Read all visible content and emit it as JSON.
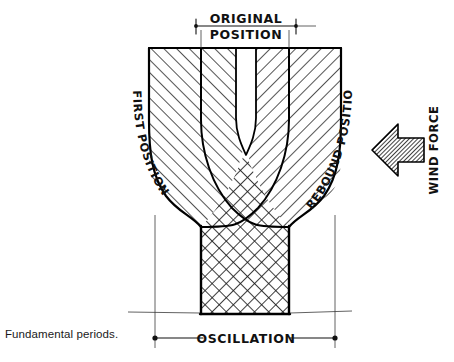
{
  "figure": {
    "caption": "Fundamental periods.",
    "labels": {
      "original_position_line1": "ORIGINAL",
      "original_position_line2": "POSITION",
      "first_position": "FIRST POSITION",
      "rebound_position": "REBOUND POSITION",
      "wind_force": "WIND FORCE",
      "oscillation": "OSCILLATION"
    },
    "colors": {
      "ink": "#000000",
      "hatch": "#222222",
      "paper": "#ffffff",
      "caption_text": "#1a1a1a"
    }
  }
}
